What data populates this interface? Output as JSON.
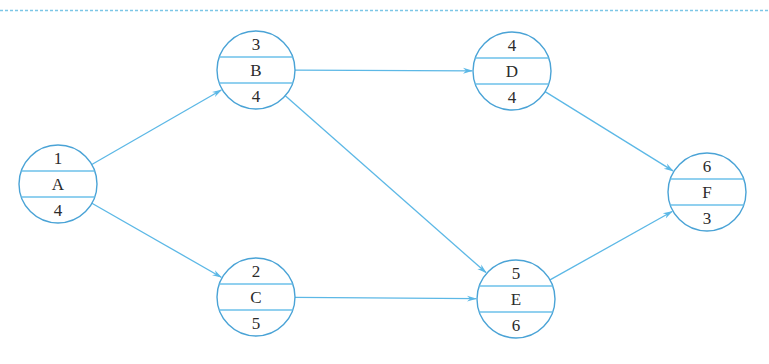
{
  "diagram": {
    "type": "activity-on-node network",
    "colors": {
      "node_stroke": "#4aa3d6",
      "arrow": "#5cb8e6",
      "divider": "#6cc0ea",
      "text": "#2b2b2b"
    },
    "nodes": [
      {
        "id": "A",
        "top": "1",
        "label": "A",
        "bottom": "4",
        "cx": 58,
        "cy": 184
      },
      {
        "id": "B",
        "top": "3",
        "label": "B",
        "bottom": "4",
        "cx": 256,
        "cy": 70
      },
      {
        "id": "C",
        "top": "2",
        "label": "C",
        "bottom": "5",
        "cx": 256,
        "cy": 297
      },
      {
        "id": "D",
        "top": "4",
        "label": "D",
        "bottom": "4",
        "cx": 512,
        "cy": 71
      },
      {
        "id": "E",
        "top": "5",
        "label": "E",
        "bottom": "6",
        "cx": 516,
        "cy": 299
      },
      {
        "id": "F",
        "top": "6",
        "label": "F",
        "bottom": "3",
        "cx": 707,
        "cy": 192
      }
    ],
    "edges": [
      {
        "from": "A",
        "to": "B"
      },
      {
        "from": "A",
        "to": "C"
      },
      {
        "from": "B",
        "to": "D"
      },
      {
        "from": "B",
        "to": "E"
      },
      {
        "from": "C",
        "to": "E"
      },
      {
        "from": "D",
        "to": "F"
      },
      {
        "from": "E",
        "to": "F"
      }
    ]
  }
}
